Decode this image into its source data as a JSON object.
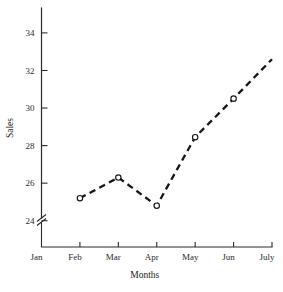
{
  "chart_data": {
    "type": "line",
    "title": "",
    "xlabel": "Months",
    "ylabel": "Sales",
    "categories": [
      "Jan",
      "Feb",
      "Mar",
      "Apr",
      "May",
      "Jun",
      "July"
    ],
    "series": [
      {
        "name": "Sales",
        "values": [
          null,
          25.2,
          26.3,
          24.8,
          28.45,
          30.5,
          32.6
        ],
        "markers": [
          false,
          true,
          true,
          true,
          true,
          true,
          false
        ],
        "line_style": "dashed",
        "marker_style": "open-circle",
        "color": "#15161a"
      }
    ],
    "ytick_labels": [
      "24",
      "26",
      "28",
      "30",
      "32",
      "34"
    ],
    "ytick_values": [
      24,
      26,
      28,
      30,
      32,
      34
    ],
    "ylim": [
      23.4,
      34.9
    ],
    "xlim": [
      0,
      6
    ],
    "grid": false,
    "legend": false,
    "y_axis_break": true,
    "background": "#ffffff"
  },
  "labels": {
    "y_axis_title": "Sales",
    "x_axis_title": "Months"
  }
}
